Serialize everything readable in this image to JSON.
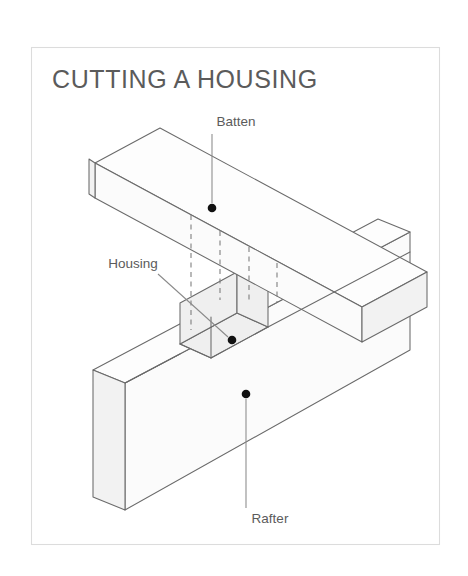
{
  "figure": {
    "title": "CUTTING A HOUSING",
    "frame": {
      "x": 31,
      "y": 47,
      "width": 409,
      "height": 498,
      "border_color": "#dcdcdc",
      "background_color": "#ffffff"
    },
    "title_position": {
      "x": 52,
      "y": 88
    },
    "line_color": "#6a6a6a",
    "hidden_line_color": "#7a7a7a",
    "leader_color": "#8a8a8a",
    "dot_color": "#111111",
    "text_color": "#5b5b5b"
  },
  "callouts": [
    {
      "id": "batten",
      "label": "Batten",
      "label_x": 236,
      "label_y": 126,
      "label_anchor": "middle",
      "leader": {
        "x1": 212,
        "y1": 134,
        "x2": 212,
        "y2": 203
      },
      "dot": {
        "cx": 212,
        "cy": 208,
        "r": 4.3
      }
    },
    {
      "id": "housing",
      "label": "Housing",
      "label_x": 133,
      "label_y": 268,
      "label_anchor": "middle",
      "leader": {
        "x1": 158,
        "y1": 274,
        "x2": 228,
        "y2": 337
      },
      "dot": {
        "cx": 232,
        "cy": 340,
        "r": 4.3
      }
    },
    {
      "id": "rafter",
      "label": "Rafter",
      "label_x": 270,
      "label_y": 523,
      "label_anchor": "middle",
      "leader": {
        "x1": 246,
        "y1": 399,
        "x2": 246,
        "y2": 508
      },
      "dot": {
        "cx": 246,
        "cy": 394,
        "r": 4.3
      }
    }
  ],
  "parts": {
    "rafter": {
      "name": "Rafter",
      "description": "Large vertical board lying at an angle, with a rectangular housing notch cut into its upper edge",
      "end_grain_hatched": true
    },
    "batten": {
      "name": "Batten",
      "description": "Long narrow timber crossing over the rafter and seated in the housing",
      "end_grain_hatched": true
    },
    "housing": {
      "name": "Housing",
      "description": "Rectangular recess cut across the rafter to receive the batten"
    }
  }
}
